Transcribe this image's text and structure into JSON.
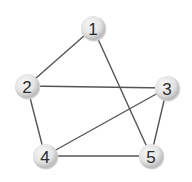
{
  "diagram": {
    "type": "undirected-graph",
    "nodes": [
      {
        "id": "1",
        "label": "1",
        "x": 93,
        "y": 28
      },
      {
        "id": "2",
        "label": "2",
        "x": 27,
        "y": 86
      },
      {
        "id": "3",
        "label": "3",
        "x": 167,
        "y": 88
      },
      {
        "id": "4",
        "label": "4",
        "x": 45,
        "y": 156
      },
      {
        "id": "5",
        "label": "5",
        "x": 151,
        "y": 156
      }
    ],
    "edges": [
      {
        "from": "1",
        "to": "2"
      },
      {
        "from": "1",
        "to": "5"
      },
      {
        "from": "2",
        "to": "3"
      },
      {
        "from": "2",
        "to": "4"
      },
      {
        "from": "3",
        "to": "4"
      },
      {
        "from": "3",
        "to": "5"
      },
      {
        "from": "4",
        "to": "5"
      }
    ],
    "colors": {
      "edge": "#555555",
      "node_fill_light": "#f4f4f4",
      "node_fill_dark": "#bdbdbd",
      "label": "#2a2a2a"
    }
  }
}
